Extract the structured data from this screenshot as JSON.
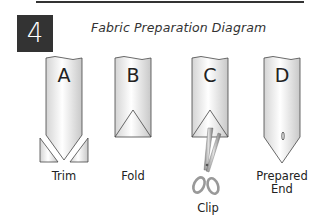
{
  "step": {
    "number": "4",
    "title": "Fabric Preparation Diagram"
  },
  "panels": [
    {
      "letter": "A",
      "caption": "Trim",
      "shape": "strip-with-trimmed-corners"
    },
    {
      "letter": "B",
      "caption": "Fold",
      "shape": "strip-with-folded-triangle"
    },
    {
      "letter": "C",
      "caption": "Clip",
      "shape": "strip-with-triangle-and-scissors"
    },
    {
      "letter": "D",
      "caption_line1": "Prepared",
      "caption_line2": "End",
      "shape": "pointed-strip-with-slit"
    }
  ],
  "colors": {
    "step_box_bg": "#333333",
    "step_box_fg": "#ffffff",
    "outline": "#444444",
    "fabric_fill_light": "#ffffff",
    "fabric_fill_dark": "#cfcfcf"
  }
}
